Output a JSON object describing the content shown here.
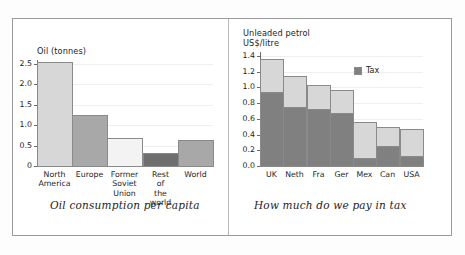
{
  "figure": {
    "background": "#ffffff",
    "border_color": "#9a9a9a",
    "divider_color": "#b9b9b9"
  },
  "palette": {
    "light_gray": "#d7d7d7",
    "very_light_gray": "#f3f3f3",
    "medium_gray": "#a8a8a8",
    "dark_gray": "#808080",
    "darker_gray": "#6e6e6e",
    "gridline": "#efefef",
    "axis": "#6a6a6a",
    "text": "#1d1d1d"
  },
  "left_panel": {
    "caption": "Oil consumption per capita",
    "axis_title": "Oil (tonnes)",
    "y_ticks": [
      "2.5",
      "2.0",
      "1.5",
      "1.0",
      "0.5",
      "0"
    ]
  },
  "right_panel": {
    "caption": "How much do we pay in tax",
    "axis_title_line1": "Unleaded petrol",
    "axis_title_line2": "US$/litre",
    "y_ticks": [
      "1.4",
      "1.2",
      "1.0",
      "0.8",
      "0.6",
      "0.4",
      "0.2",
      "0.0"
    ],
    "legend": [
      {
        "label": "Tax",
        "color": "#808080"
      }
    ]
  },
  "chart_data": [
    {
      "type": "bar",
      "id": "oil-consumption-per-capita",
      "title": "Oil consumption per capita",
      "xlabel": "",
      "ylabel": "Oil (tonnes)",
      "ylim": [
        0,
        2.6
      ],
      "yticks": [
        0,
        0.5,
        1.0,
        1.5,
        2.0,
        2.5
      ],
      "ytick_labels": [
        "0",
        "0.5",
        "1.0",
        "1.5",
        "2.0",
        "2.5"
      ],
      "grid": true,
      "legend": "none",
      "categories": [
        "North America",
        "Europe",
        "Former Soviet Union",
        "Rest of the world",
        "World"
      ],
      "values": [
        2.55,
        1.26,
        0.68,
        0.33,
        0.63
      ],
      "bar_colors": [
        "#d7d7d7",
        "#a8a8a8",
        "#f3f3f3",
        "#6e6e6e",
        "#a8a8a8"
      ]
    },
    {
      "type": "bar",
      "id": "unleaded-petrol-tax",
      "title": "How much do we pay in tax",
      "subtitle": "Unleaded petrol US$/litre",
      "stacked": true,
      "xlabel": "",
      "ylabel": "US$/litre",
      "ylim": [
        0,
        1.45
      ],
      "yticks": [
        0.0,
        0.2,
        0.4,
        0.6,
        0.8,
        1.0,
        1.2,
        1.4
      ],
      "ytick_labels": [
        "0.0",
        "0.2",
        "0.4",
        "0.6",
        "0.8",
        "1.0",
        "1.2",
        "1.4"
      ],
      "grid": true,
      "legend": "upper right",
      "categories": [
        "UK",
        "Neth",
        "Fra",
        "Ger",
        "Mex",
        "Can",
        "USA"
      ],
      "series": [
        {
          "name": "Tax",
          "color": "#808080",
          "values": [
            0.94,
            0.75,
            0.72,
            0.67,
            0.1,
            0.26,
            0.13
          ]
        },
        {
          "name": "Base price",
          "color": "#d7d7d7",
          "values": [
            0.42,
            0.4,
            0.31,
            0.29,
            0.46,
            0.24,
            0.34
          ]
        }
      ],
      "totals": [
        1.36,
        1.15,
        1.03,
        0.96,
        0.56,
        0.5,
        0.47
      ]
    }
  ]
}
